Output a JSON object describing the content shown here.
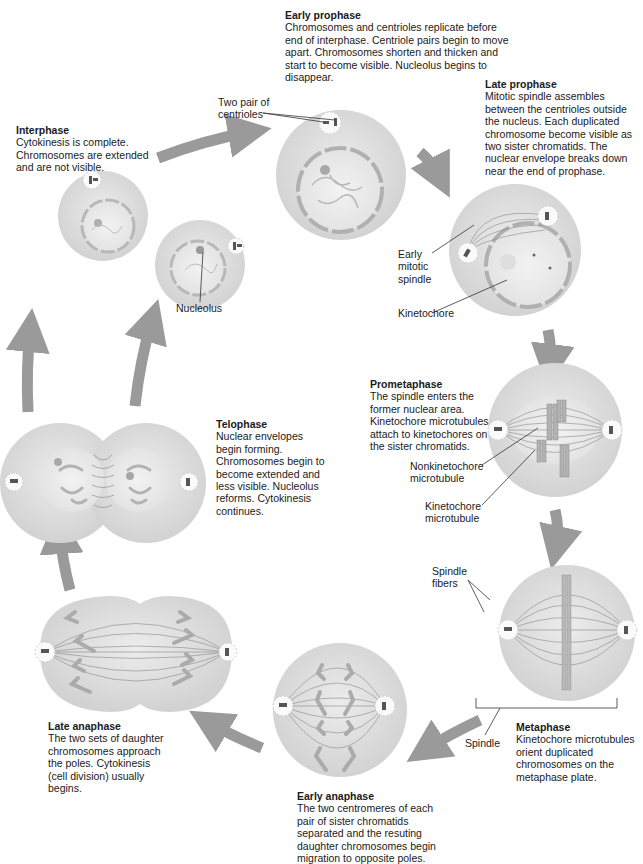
{
  "diagram": {
    "colors": {
      "cell_fill": "#dcdcdc",
      "nucleus_fill": "#ebebeb",
      "arrow": "#9a9a9a",
      "chromosome": "#a8a8a8",
      "text": "#1a1a1a"
    },
    "phases": [
      {
        "id": "interphase",
        "title": "Interphase",
        "body": "Cytokinesis is complete. Chromosomes are extended and are not visible."
      },
      {
        "id": "early-prophase",
        "title": "Early prophase",
        "body": "Chromosomes and centrioles replicate before end of interphase. Centriole pairs begin to move apart. Chromosomes shorten and thicken and start to become visible. Nucleolus begins to disappear."
      },
      {
        "id": "late-prophase",
        "title": "Late prophase",
        "body": "Mitotic spindle assembles between the centrioles outside the nucleus. Each duplicated chromosome become visible as two sister chromatids. The nuclear envelope breaks down near the end of prophase."
      },
      {
        "id": "prometaphase",
        "title": "Prometaphase",
        "body": "The spindle enters the former nuclear area. Kinetochore microtubules attach to kinetochores on the sister chromatids."
      },
      {
        "id": "metaphase",
        "title": "Metaphase",
        "body": "Kinetochore microtubules orient duplicated chromosomes on the metaphase plate."
      },
      {
        "id": "early-anaphase",
        "title": "Early anaphase",
        "body": "The two centromeres of each pair of sister chromatids separated and the resuting daughter chromosomes begin migration to opposite poles."
      },
      {
        "id": "late-anaphase",
        "title": "Late anaphase",
        "body": "The two sets of daughter chromosomes approach the poles. Cytokinesis (cell division) usually begins."
      },
      {
        "id": "telophase",
        "title": "Telophase",
        "body": "Nuclear envelopes begin forming. Chromosomes begin to become extended and less visible. Nucleolus reforms. Cytokinesis continues."
      }
    ],
    "callouts": {
      "two_pair_centrioles": "Two pair of centrioles",
      "nucleolus": "Nucleolus",
      "early_mitotic_spindle": "Early mitotic spindle",
      "kinetochore": "Kinetochore",
      "nonkinetochore_microtubule": "Nonkinetochore microtubule",
      "kinetochore_microtubule": "Kinetochore microtubule",
      "spindle_fibers": "Spindle fibers",
      "spindle": "Spindle"
    }
  }
}
